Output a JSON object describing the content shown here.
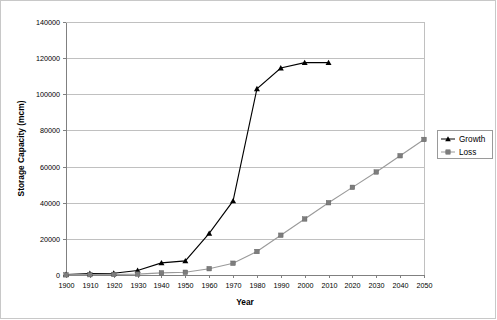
{
  "chart_data": {
    "type": "line",
    "title": "",
    "xlabel": "Year",
    "ylabel": "Storage Capacity (mcm)",
    "xlim": [
      1900,
      2050
    ],
    "ylim": [
      0,
      140000
    ],
    "grid": true,
    "legend_position": "right",
    "x_ticks": [
      1900,
      1910,
      1920,
      1930,
      1940,
      1950,
      1960,
      1970,
      1980,
      1990,
      2000,
      2010,
      2020,
      2030,
      2040,
      2050
    ],
    "y_ticks": [
      0,
      20000,
      40000,
      60000,
      80000,
      100000,
      120000,
      140000
    ],
    "x_tick_labels": [
      "1900",
      "1910",
      "1920",
      "1930",
      "1940",
      "1950",
      "1960",
      "1970",
      "1980",
      "1990",
      "2000",
      "2010",
      "2020",
      "2030",
      "2040",
      "2050"
    ],
    "y_tick_labels": [
      "0",
      "20000",
      "40000",
      "60000",
      "80000",
      "100000",
      "120000",
      "140000"
    ],
    "series": [
      {
        "name": "Growth",
        "color": "#000000",
        "marker": "triangle",
        "x": [
          1900,
          1910,
          1920,
          1930,
          1940,
          1950,
          1960,
          1970,
          1980,
          1990,
          2000,
          2010
        ],
        "values": [
          300,
          800,
          1000,
          2500,
          6700,
          7800,
          23000,
          41000,
          103000,
          114500,
          117500,
          117500
        ]
      },
      {
        "name": "Loss",
        "color": "#7d7d7d",
        "marker": "square",
        "x": [
          1900,
          1910,
          1920,
          1930,
          1940,
          1950,
          1960,
          1970,
          1980,
          1990,
          2000,
          2010,
          2020,
          2030,
          2040,
          2050
        ],
        "values": [
          100,
          200,
          300,
          500,
          1200,
          1500,
          3500,
          6500,
          13000,
          22000,
          31000,
          40000,
          48500,
          57000,
          66000,
          75000
        ]
      }
    ]
  },
  "legend": {
    "entries": [
      {
        "label": "Growth"
      },
      {
        "label": "Loss"
      }
    ]
  }
}
